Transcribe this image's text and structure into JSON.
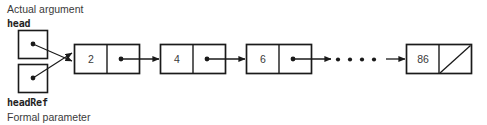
{
  "figure": {
    "type": "linked-list-diagram",
    "background_color": "#ffffff",
    "stroke_color": "#1a1a1a",
    "text_color": "#3a3a3a"
  },
  "labels": {
    "top_caption": "Actual argument",
    "top_variable": "head",
    "bottom_variable": "headRef",
    "bottom_caption": "Formal parameter"
  },
  "pointer_boxes": [
    {
      "id": "head-box",
      "name": "head"
    },
    {
      "id": "headref-box",
      "name": "headRef"
    }
  ],
  "list": {
    "nodes": [
      {
        "value": "2",
        "next": "pointer"
      },
      {
        "value": "4",
        "next": "pointer"
      },
      {
        "value": "6",
        "next": "pointer"
      },
      {
        "value": "86",
        "next": "null"
      }
    ],
    "ellipsis": "• • • •",
    "ellipsis_dot_count": 4,
    "null_marker": "diagonal-slash"
  }
}
